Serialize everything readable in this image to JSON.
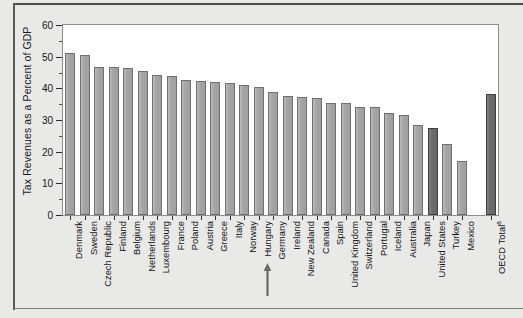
{
  "chart_data": {
    "type": "bar",
    "title": "",
    "xlabel": "",
    "ylabel": "Tax Revenues as a Percent of GDP",
    "ylim": [
      0,
      60
    ],
    "ytick_labels": [
      "0",
      "10",
      "20",
      "30",
      "40",
      "50",
      "60"
    ],
    "ytick_values": [
      0,
      10,
      20,
      30,
      40,
      50,
      60
    ],
    "minor_tick_step": 5,
    "grid": false,
    "legend": "none",
    "categories": [
      "Denmark",
      "Sweden",
      "Czech Republic",
      "Finland",
      "Belgium",
      "Netherlands",
      "Luxembourg",
      "France",
      "Poland",
      "Austria",
      "Greece",
      "Italy",
      "Norway",
      "Hungary",
      "Germany",
      "Ireland",
      "New Zealand",
      "Canada",
      "Spain",
      "United Kingdom",
      "Switzerland",
      "Portugal",
      "Iceland",
      "Australia",
      "Japan",
      "United States",
      "Turkey",
      "Mexico",
      "OECD Total"
    ],
    "values": [
      51.2,
      50.4,
      46.6,
      46.7,
      46.3,
      45.5,
      44.3,
      43.9,
      42.7,
      42.4,
      42.0,
      41.7,
      41.0,
      40.5,
      39.0,
      37.6,
      37.4,
      36.8,
      35.5,
      35.3,
      34.1,
      34.0,
      32.3,
      31.7,
      28.4,
      27.6,
      22.4,
      17.2,
      38.2
    ],
    "highlighted_bars": [
      "United States",
      "OECD Total"
    ],
    "bar_color": "#a8a8a8",
    "highlight_color": "#6f6f6f",
    "annotations": [
      {
        "type": "arrow",
        "points_to": "Germany",
        "direction": "up"
      },
      {
        "type": "footnote-marker",
        "label": "OECD Total",
        "marker": "a"
      }
    ],
    "labels": {
      "oecd_total": "OECD Total",
      "oecd_total_marker": "a"
    }
  }
}
